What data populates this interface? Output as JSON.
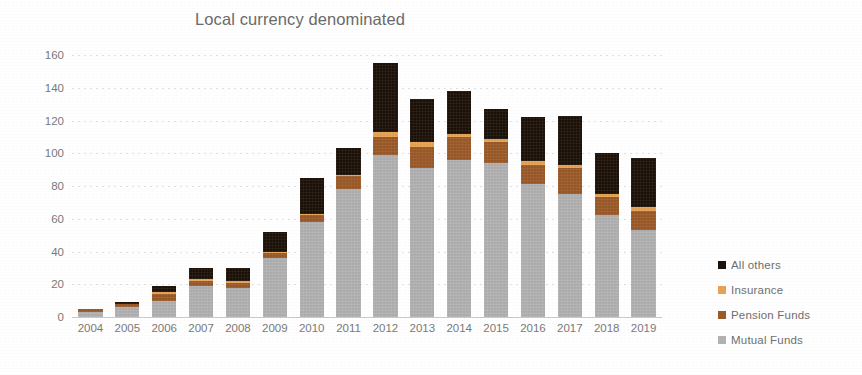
{
  "chart_data": {
    "type": "bar",
    "stacked": true,
    "title": "Local currency denominated",
    "xlabel": "",
    "ylabel": "",
    "ylim": [
      0,
      160
    ],
    "ytick_step": 20,
    "yticks": [
      160,
      140,
      120,
      100,
      80,
      60,
      40,
      20,
      0
    ],
    "grid": true,
    "legend_position": "right",
    "categories": [
      "2004",
      "2005",
      "2006",
      "2007",
      "2008",
      "2009",
      "2010",
      "2011",
      "2012",
      "2013",
      "2014",
      "2015",
      "2016",
      "2017",
      "2018",
      "2019"
    ],
    "series": [
      {
        "name": "Mutual Funds",
        "color": "#B2B2B2",
        "values": [
          3,
          6,
          10,
          19,
          18,
          36,
          58,
          78,
          99,
          91,
          96,
          94,
          81,
          75,
          62,
          53
        ]
      },
      {
        "name": "Pension Funds",
        "color": "#9C5A28",
        "values": [
          2,
          2,
          4,
          3,
          3,
          3,
          4,
          8,
          11,
          13,
          14,
          13,
          12,
          16,
          11,
          12
        ]
      },
      {
        "name": "Insurance",
        "color": "#E8A354",
        "values": [
          0,
          0,
          1,
          1,
          1,
          1,
          1,
          1,
          3,
          3,
          2,
          2,
          2,
          2,
          2,
          2
        ]
      },
      {
        "name": "All others",
        "color": "#1C1209",
        "values": [
          0,
          1,
          4,
          7,
          8,
          12,
          22,
          16,
          42,
          26,
          26,
          18,
          27,
          30,
          25,
          30
        ]
      }
    ],
    "totals": [
      5,
      9,
      19,
      30,
      30,
      52,
      85,
      103,
      155,
      133,
      138,
      127,
      122,
      123,
      100,
      97
    ]
  },
  "legend": {
    "items": [
      {
        "label": "All others",
        "color": "#1C1209"
      },
      {
        "label": "Insurance",
        "color": "#E8A354"
      },
      {
        "label": "Pension Funds",
        "color": "#9C5A28"
      },
      {
        "label": "Mutual Funds",
        "color": "#B2B2B2"
      }
    ]
  },
  "colors": {
    "all_others": "#1C1209",
    "insurance": "#E8A354",
    "pension_funds": "#9C5A28",
    "mutual_funds": "#B2B2B2",
    "text": "#6f6f6f",
    "gridline": "#969696",
    "background": "#FFFFFF"
  }
}
